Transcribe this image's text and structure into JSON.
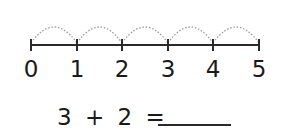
{
  "number_line": {
    "labels": [
      "0",
      "1",
      "2",
      "3",
      "4",
      "5"
    ],
    "tick_x": [
      31,
      77,
      122,
      168,
      213,
      259
    ],
    "line_y": 45,
    "arc_count": 5,
    "arc_style": "dotted",
    "line_color": "#2a2a2a",
    "arc_color": "#9a9a9a"
  },
  "equation": {
    "a": "3",
    "op": "+",
    "b": "2",
    "eq": "=",
    "answer": ""
  }
}
